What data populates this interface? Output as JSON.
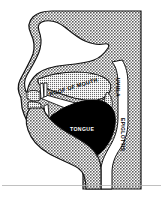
{
  "figure": {
    "kind": "anatomical-line-diagram",
    "width_px": 163,
    "height_px": 200,
    "background_color": "#ffffff",
    "tissue_fill_color": "#9c9c9c",
    "airway_fill_color": "#ffffff",
    "tongue_fill_color": "#000000",
    "outline_color": "#000000",
    "baseline_rule_color": "#b0b0b0"
  },
  "labels": {
    "roof_of_mouth": "ROOF OF MOUTH",
    "uvula": "UVULA",
    "epiglottis": "EPIGLOTTIS",
    "tongue": "TONGUE"
  },
  "label_styles": {
    "roof_of_mouth_color": "#000000",
    "uvula_color": "#000000",
    "epiglottis_color": "#000000",
    "tongue_color": "#ffffff"
  },
  "regions": {
    "nasal_cavity": "nasal-cavity",
    "oral_cavity": "oral-cavity",
    "pharynx": "pharynx",
    "upper_teeth": "upper-teeth",
    "lower_teeth": "lower-teeth",
    "lips": "lips",
    "jaw": "jaw",
    "head_tissue": "head-tissue"
  }
}
